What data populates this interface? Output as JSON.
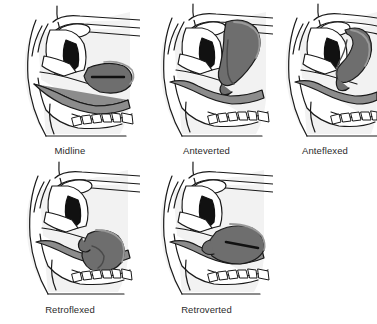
{
  "figure": {
    "type": "medical-illustration",
    "background_color": "#ffffff",
    "panel_count": 5,
    "grid": "3 columns x 2 rows, last cell empty",
    "palette": {
      "outline": "#1a1a1a",
      "uterus_fill": "#6e6e6e",
      "uterus_shadow": "#4a4a4a",
      "uterus_highlight": "#9a9a9a",
      "bowel_fill": "#8c8c8c",
      "cavity_black": "#111111",
      "body_white": "#ffffff",
      "soft_shadow": "#e8e8e8",
      "label_text": "#2b2b2b"
    },
    "panels": [
      {
        "id": "midline",
        "label": "Midline",
        "description": "Sagittal pelvic section with uterus lying horizontally over the bladder",
        "uterus_orientation": "horizontal"
      },
      {
        "id": "anteverted",
        "label": "Anteverted",
        "description": "Sagittal pelvic section with uterus tilted forward and upright",
        "uterus_orientation": "upright-forward"
      },
      {
        "id": "anteflexed",
        "label": "Anteflexed",
        "description": "Sagittal pelvic section with uterine body folded forward on the cervix",
        "uterus_orientation": "folded-forward"
      },
      {
        "id": "retroflexed",
        "label": "Retroflexed",
        "description": "Sagittal pelvic section with uterine body bent backward on the cervix",
        "uterus_orientation": "folded-backward"
      },
      {
        "id": "retroverted",
        "label": "Retroverted",
        "description": "Sagittal pelvic section with uterus tilted backward toward the rectum",
        "uterus_orientation": "tilted-backward"
      }
    ]
  }
}
